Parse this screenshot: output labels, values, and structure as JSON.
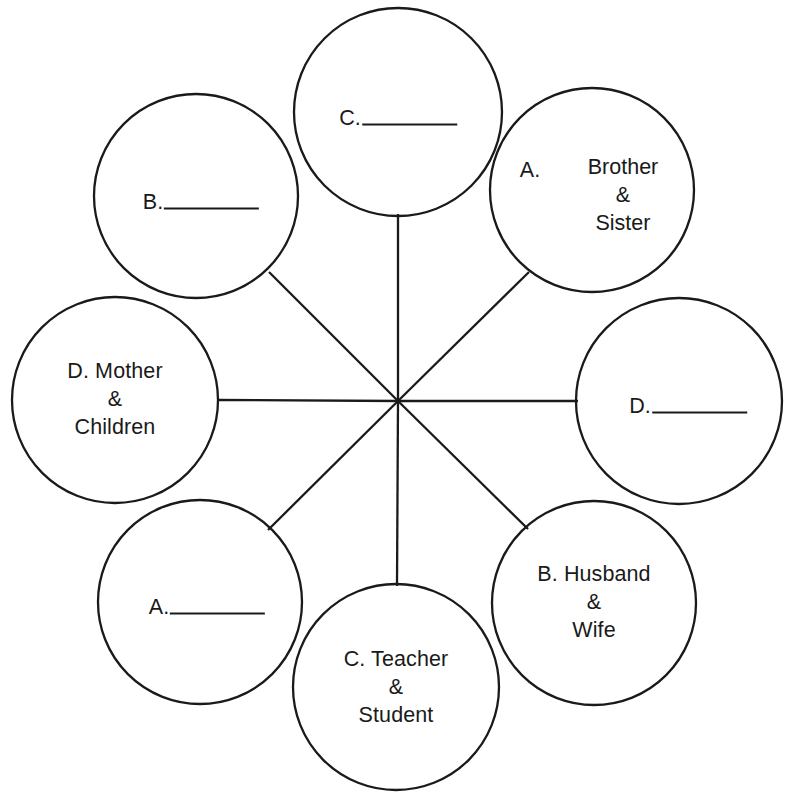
{
  "worksheet": {
    "title_fragment": "",
    "stroke_color": "#1a1a1a",
    "text_color": "#1a1a1a",
    "background_color": "#ffffff"
  },
  "diagram": {
    "type": "radial-spoke",
    "center_hub": {
      "x": 398,
      "y": 401
    },
    "node_count": 8,
    "node_radius": 103,
    "orbit_radius": 183
  },
  "nodes": [
    {
      "position": "top",
      "kind": "blank",
      "letter": "C.",
      "answer": "",
      "cx": 398,
      "cy": 112
    },
    {
      "position": "top-right",
      "kind": "filled",
      "letter": "A.",
      "answer": "Brother\n&\nSister",
      "cx": 592,
      "cy": 190
    },
    {
      "position": "right",
      "kind": "blank",
      "letter": "D.",
      "answer": "",
      "cx": 679,
      "cy": 401
    },
    {
      "position": "bottom-right",
      "kind": "filled",
      "letter": "B.",
      "answer": "B. Husband\n&\nWife",
      "cx": 594,
      "cy": 603
    },
    {
      "position": "bottom",
      "kind": "filled",
      "letter": "C.",
      "answer": "C. Teacher\n&\nStudent",
      "cx": 396,
      "cy": 687
    },
    {
      "position": "bottom-left",
      "kind": "blank",
      "letter": "A.",
      "answer": "",
      "cx": 200,
      "cy": 602
    },
    {
      "position": "left",
      "kind": "filled",
      "letter": "D.",
      "answer": "D. Mother\n&\nChildren",
      "cx": 115,
      "cy": 400
    },
    {
      "position": "top-left",
      "kind": "blank",
      "letter": "B.",
      "answer": "",
      "cx": 196,
      "cy": 196
    }
  ],
  "labels": {
    "top_blank_letter": "C.",
    "topright_letter": "A.",
    "topright_body": "Brother\n&\nSister",
    "right_blank_letter": "D.",
    "bottomright_body": "B. Husband\n&\nWife",
    "bottom_body": "C. Teacher\n&\nStudent",
    "bottomleft_blank_letter": "A.",
    "left_body": "D. Mother\n&\nChildren",
    "topleft_blank_letter": "B."
  }
}
